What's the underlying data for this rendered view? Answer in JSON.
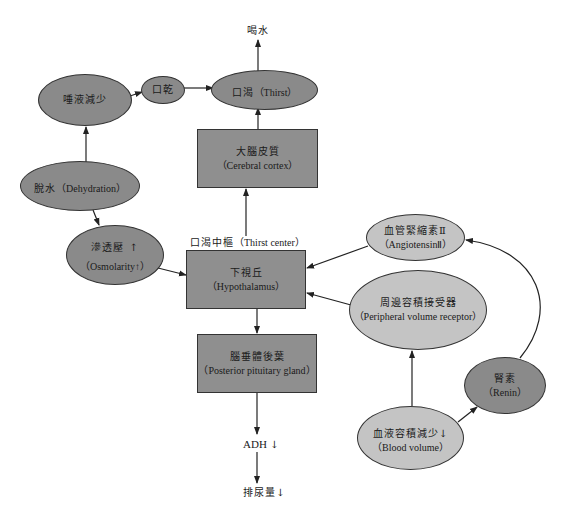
{
  "diagram": {
    "colors": {
      "dark_fill": "#8a8a8a",
      "light_fill": "#c4c4c4",
      "stroke": "#333333",
      "background": "#ffffff"
    },
    "nodes": {
      "drink_water": {
        "zh": "喝水"
      },
      "saliva": {
        "zh": "唾液減少"
      },
      "dry_mouth": {
        "zh": "口乾"
      },
      "thirst": {
        "zh": "口渴",
        "en": "（Thirst）"
      },
      "cerebral_cortex": {
        "zh": "大腦皮質",
        "en": "（Cerebral cortex）"
      },
      "dehydration": {
        "zh": "脫水",
        "en": "（Dehydration）"
      },
      "osmolarity": {
        "zh": "滲透壓",
        "en": "（Osmolarity",
        "arrow": "↑",
        "en_close": "）"
      },
      "thirst_center": {
        "zh": "口渴中樞",
        "en": "（Thirst center）"
      },
      "hypothalamus": {
        "zh": "下視丘",
        "en": "（Hypothalamus）"
      },
      "posterior_pituitary": {
        "zh": "腦垂體後葉",
        "en": "（Posterior pituitary gland）"
      },
      "adh": {
        "text": "ADH",
        "arrow": "↓"
      },
      "urine": {
        "zh": "排尿量",
        "arrow": "↓"
      },
      "angiotensin": {
        "zh": "血管緊縮素Ⅱ",
        "en": "（AngiotensinⅡ）"
      },
      "peripheral_receptor": {
        "zh": "周邊容積接受器",
        "en": "（Peripheral volume receptor）"
      },
      "renin": {
        "zh": "腎素",
        "en": "（Renin）"
      },
      "blood_volume": {
        "zh": "血液容積減少",
        "arrow": "↓",
        "en": "（Blood volume）"
      }
    },
    "edges": [
      {
        "from": "dehydration",
        "to": "saliva"
      },
      {
        "from": "saliva",
        "to": "dry_mouth"
      },
      {
        "from": "dry_mouth",
        "to": "thirst"
      },
      {
        "from": "thirst",
        "to": "drink_water"
      },
      {
        "from": "cerebral_cortex",
        "to": "thirst"
      },
      {
        "from": "hypothalamus",
        "to": "cerebral_cortex"
      },
      {
        "from": "dehydration",
        "to": "osmolarity"
      },
      {
        "from": "osmolarity",
        "to": "hypothalamus"
      },
      {
        "from": "angiotensin",
        "to": "hypothalamus"
      },
      {
        "from": "peripheral_receptor",
        "to": "hypothalamus"
      },
      {
        "from": "hypothalamus",
        "to": "posterior_pituitary"
      },
      {
        "from": "posterior_pituitary",
        "to": "adh"
      },
      {
        "from": "adh",
        "to": "urine"
      },
      {
        "from": "blood_volume",
        "to": "peripheral_receptor"
      },
      {
        "from": "blood_volume",
        "to": "renin"
      },
      {
        "from": "renin",
        "to": "angiotensin"
      }
    ]
  }
}
